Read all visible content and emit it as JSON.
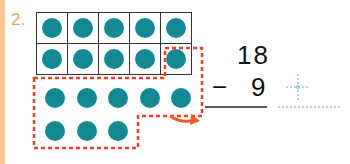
{
  "problem": {
    "number_label": "2.",
    "ten_frame": {
      "rows": 2,
      "cols": 5,
      "filled": 10
    },
    "loose_dots": {
      "row1": 5,
      "row2": 3
    },
    "minuend": "18",
    "operator": "−",
    "subtrahend": "9",
    "answer": ""
  },
  "colors": {
    "dot": "#138a93",
    "dashed_outline": "#e8402a",
    "answer_guide": "#9cc3ea",
    "number_label": "#e8a060"
  }
}
